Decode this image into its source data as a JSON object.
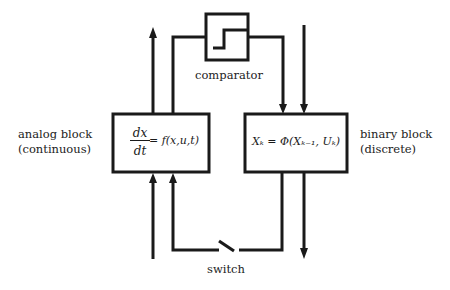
{
  "diagram": {
    "type": "block-diagram",
    "title": "",
    "nodes": {
      "comparator": {
        "label": "comparator",
        "icon": "step-function-icon"
      },
      "analog_block": {
        "label_line1": "analog block",
        "label_line2": "(continuous)",
        "formula_numerator": "dx",
        "formula_denominator": "dt",
        "formula_rhs": "= f(x,u,t)"
      },
      "binary_block": {
        "label_line1": "binary block",
        "label_line2": "(discrete)",
        "formula": "Xₖ = Φ(Xₖ₋₁, Uₖ)"
      },
      "switch": {
        "label": "switch"
      }
    },
    "edges": [
      {
        "from": "analog_block",
        "to": "output-top-left",
        "direction": "up"
      },
      {
        "from": "analog_block",
        "to": "comparator",
        "direction": "up-then-right"
      },
      {
        "from": "comparator",
        "to": "binary_block",
        "direction": "right-then-down"
      },
      {
        "from": "input-top-right",
        "to": "binary_block",
        "direction": "down"
      },
      {
        "from": "input-bottom-left",
        "to": "analog_block",
        "direction": "up"
      },
      {
        "from": "binary_block",
        "to": "analog_block",
        "via": "switch",
        "direction": "down-left-up"
      },
      {
        "from": "binary_block",
        "to": "output-bottom-right",
        "direction": "down"
      }
    ]
  }
}
